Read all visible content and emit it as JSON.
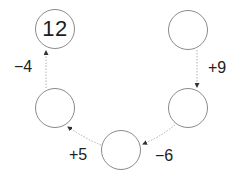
{
  "diagram": {
    "type": "operation-chain",
    "colors": {
      "circle_stroke": "#8a8a8a",
      "arrow": "#b0b0b0",
      "text": "#1e1e1e"
    },
    "nodes": [
      {
        "id": "top-left",
        "value": "12",
        "cx": 55,
        "cy": 29
      },
      {
        "id": "top-right",
        "value": "",
        "cx": 188,
        "cy": 30
      },
      {
        "id": "right-middle",
        "value": "",
        "cx": 188,
        "cy": 108
      },
      {
        "id": "bottom",
        "value": "",
        "cx": 121,
        "cy": 150
      },
      {
        "id": "left-middle",
        "value": "",
        "cx": 55,
        "cy": 108
      }
    ],
    "operations": [
      {
        "from": "top-right",
        "to": "right-middle",
        "label": "+9",
        "x": 217,
        "y": 68
      },
      {
        "from": "right-middle",
        "to": "bottom",
        "label": "−6",
        "x": 164,
        "y": 156
      },
      {
        "from": "bottom",
        "to": "left-middle",
        "label": "+5",
        "x": 78,
        "y": 155
      },
      {
        "from": "left-middle",
        "to": "top-left",
        "label": "−4",
        "x": 23,
        "y": 67
      }
    ]
  }
}
